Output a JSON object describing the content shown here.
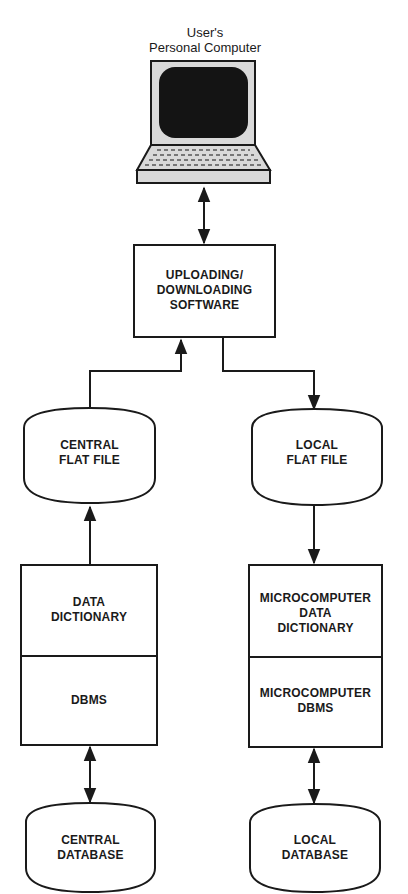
{
  "diagram": {
    "computer": {
      "label_line1": "User's",
      "label_line2": "Personal Computer"
    },
    "software": {
      "line1": "UPLOADING/",
      "line2": "DOWNLOADING",
      "line3": "SOFTWARE"
    },
    "central_flat_file": {
      "line1": "CENTRAL",
      "line2": "FLAT FILE"
    },
    "local_flat_file": {
      "line1": "LOCAL",
      "line2": "FLAT FILE"
    },
    "data_dictionary": {
      "line1": "DATA",
      "line2": "DICTIONARY"
    },
    "dbms": {
      "line1": "DBMS"
    },
    "micro_data_dictionary": {
      "line1": "MICROCOMPUTER",
      "line2": "DATA",
      "line3": "DICTIONARY"
    },
    "micro_dbms": {
      "line1": "MICROCOMPUTER",
      "line2": "DBMS"
    },
    "central_database": {
      "line1": "CENTRAL",
      "line2": "DATABASE"
    },
    "local_database": {
      "line1": "LOCAL",
      "line2": "DATABASE"
    },
    "colors": {
      "ink": "#1a1a1a",
      "screen": "#141414",
      "body": "#d9d9d9"
    }
  }
}
